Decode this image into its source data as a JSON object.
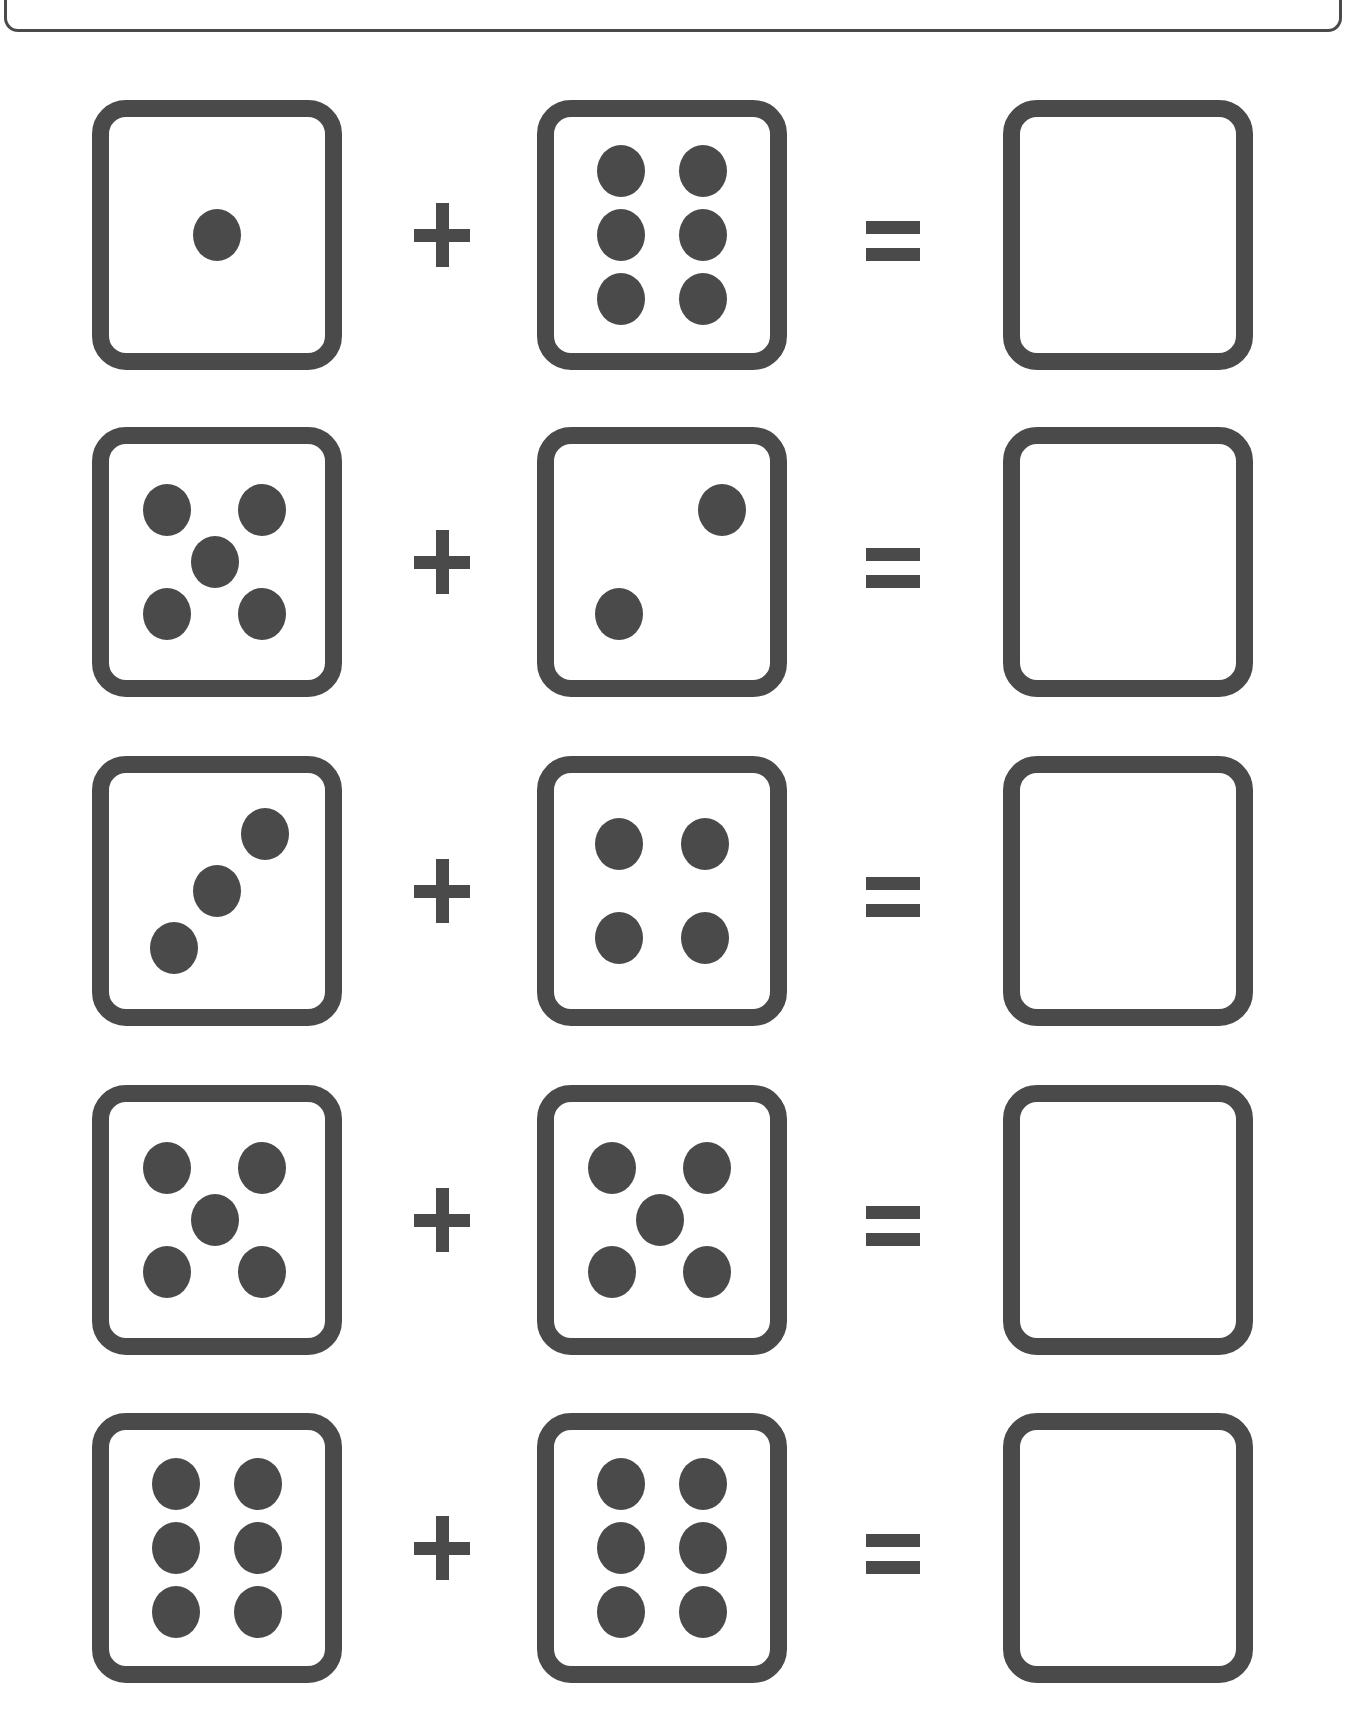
{
  "worksheet": {
    "title": "",
    "colors": {
      "ink": "#4a4a4a",
      "background": "#ffffff"
    },
    "problems": [
      {
        "left_die": 1,
        "operator": "+",
        "right_die": 6,
        "equals": "=",
        "answer": ""
      },
      {
        "left_die": 5,
        "operator": "+",
        "right_die": 2,
        "equals": "=",
        "answer": ""
      },
      {
        "left_die": 3,
        "operator": "+",
        "right_die": 4,
        "equals": "=",
        "answer": ""
      },
      {
        "left_die": 5,
        "operator": "+",
        "right_die": 5,
        "equals": "=",
        "answer": ""
      },
      {
        "left_die": 6,
        "operator": "+",
        "right_die": 6,
        "equals": "=",
        "answer": ""
      }
    ]
  }
}
